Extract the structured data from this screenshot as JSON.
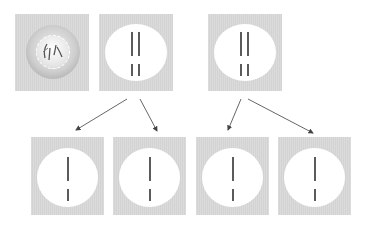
{
  "diagram": {
    "type": "cell-division-schematic",
    "colors": {
      "cell_background": "#d3d3d3",
      "disc": "#ffffff",
      "chromosome": "#333333",
      "arrow": "#444444"
    },
    "top_row": [
      {
        "id": "interphase-cell",
        "stage": "parent cell with nucleus",
        "chromosomes": "curved strands inside nucleus"
      },
      {
        "id": "cell-two-pairs-a",
        "stage": "two pairs of chromosomes (long pair above short pair)"
      },
      {
        "id": "cell-two-pairs-b",
        "stage": "two pairs of chromosomes (long pair above short pair)"
      }
    ],
    "bottom_row": [
      {
        "id": "daughter-1",
        "stage": "single long + single short chromosome"
      },
      {
        "id": "daughter-2",
        "stage": "single long + single short chromosome"
      },
      {
        "id": "daughter-3",
        "stage": "single long + single short chromosome"
      },
      {
        "id": "daughter-4",
        "stage": "single long + single short chromosome"
      }
    ],
    "arrows": [
      {
        "from": "cell-two-pairs-a",
        "to": "daughter-1"
      },
      {
        "from": "cell-two-pairs-a",
        "to": "daughter-2"
      },
      {
        "from": "cell-two-pairs-b",
        "to": "daughter-3"
      },
      {
        "from": "cell-two-pairs-b",
        "to": "daughter-4"
      }
    ]
  }
}
